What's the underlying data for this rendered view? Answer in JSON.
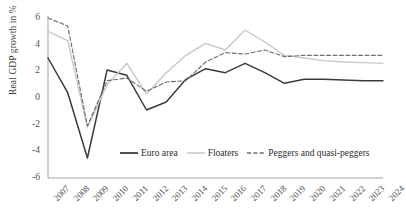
{
  "chart_data": {
    "type": "line",
    "title": "",
    "xlabel": "",
    "ylabel": "Real GDP growth in %",
    "categories": [
      "2007",
      "2008",
      "2009",
      "2010",
      "2011",
      "2012",
      "2013",
      "2014",
      "2015",
      "2016",
      "2017",
      "2018",
      "2019",
      "2020",
      "2021",
      "2022",
      "2023",
      "2024"
    ],
    "ylim": [
      -6,
      6
    ],
    "yticks": [
      6,
      4,
      2,
      0,
      -2,
      -4,
      -6
    ],
    "grid": false,
    "legend_position": "inside-bottom-center",
    "series": [
      {
        "name": "Euro area",
        "color": "#3c3c3c",
        "style": "solid",
        "values": [
          3.0,
          0.4,
          -4.5,
          2.1,
          1.7,
          -0.9,
          -0.3,
          1.4,
          2.2,
          1.9,
          2.6,
          1.9,
          1.1,
          1.4,
          1.4,
          1.35,
          1.3,
          1.3
        ]
      },
      {
        "name": "Floaters",
        "color": "#c8c8c8",
        "style": "solid",
        "values": [
          5.0,
          4.3,
          -2.2,
          1.0,
          2.6,
          0.3,
          1.9,
          3.2,
          4.1,
          3.6,
          5.1,
          4.2,
          3.2,
          3.0,
          2.8,
          2.7,
          2.65,
          2.6
        ]
      },
      {
        "name": "Peggers and quasi-peggers",
        "color": "#6e6e6e",
        "style": "dashed",
        "values": [
          6.0,
          5.4,
          -2.1,
          1.3,
          1.5,
          0.5,
          1.2,
          1.3,
          2.7,
          3.4,
          3.3,
          3.6,
          3.1,
          3.2,
          3.2,
          3.2,
          3.2,
          3.2
        ]
      }
    ]
  },
  "legend": {
    "items": [
      {
        "label": "Euro area"
      },
      {
        "label": "Floaters"
      },
      {
        "label": "Peggers and quasi-peggers"
      }
    ]
  }
}
